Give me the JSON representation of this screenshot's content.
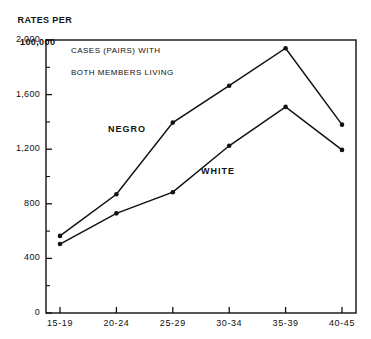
{
  "axis_header": {
    "line1": "RATES PER",
    "line2": "100,000"
  },
  "chart_data": {
    "type": "line",
    "title": "CASES (PAIRS) WITH\nBOTH MEMBERS LIVING",
    "title_line1": "CASES (PAIRS) WITH",
    "title_line2": "BOTH MEMBERS LIVING",
    "xlabel": "",
    "ylabel": "RATES PER 100,000",
    "categories": [
      "15-19",
      "20-24",
      "25-29",
      "30-34",
      "35-39",
      "40-45"
    ],
    "series": [
      {
        "name": "NEGRO",
        "values": [
          565,
          870,
          1395,
          1665,
          1940,
          1380
        ],
        "color": "#111111",
        "label_x": 108,
        "label_y": 124
      },
      {
        "name": "WHITE",
        "values": [
          505,
          730,
          885,
          1225,
          1510,
          1195
        ],
        "color": "#111111",
        "label_x": 201,
        "label_y": 166
      }
    ],
    "ylim": [
      0,
      2000
    ],
    "y_ticks": [
      0,
      400,
      800,
      1200,
      1600,
      2000
    ],
    "y_tick_labels": [
      "0",
      "400",
      "800",
      "1,200",
      "1,600",
      "2,000"
    ],
    "y_minor_ticks": [
      200,
      600,
      1000,
      1400,
      1800
    ],
    "grid": false,
    "legend_position": "inline-annotation",
    "marker": "filled-circle",
    "frame": true
  }
}
